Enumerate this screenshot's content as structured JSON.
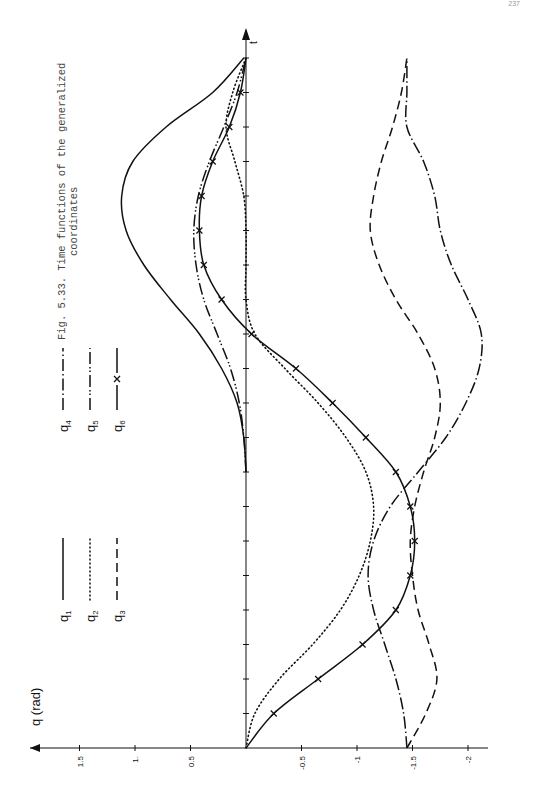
{
  "page": {
    "number": "237"
  },
  "caption": {
    "line1": "Fig. 5.33. Time functions of the generalized",
    "line2": "coordinates"
  },
  "chart_data": {
    "type": "line",
    "title": "Time functions of the generalized coordinates",
    "orientation": "rotated 90° counter-clockwise (t axis vertical pointing up, q axis horizontal with positive values to the left)",
    "xlabel": "t",
    "ylabel": "q (rad)",
    "ylim": [
      -2.3,
      1.8
    ],
    "yticks": [
      1.5,
      1,
      0.5,
      0,
      -0.5,
      -1,
      -1.5,
      -2
    ],
    "ytick_labels": [
      "1.5",
      "1.",
      "0.5",
      "",
      "-0.5",
      "-1",
      "-1.5",
      "-2"
    ],
    "xlim": [
      0,
      20.8
    ],
    "x_tick_count": 20,
    "x_tick_labels": [],
    "grid": false,
    "legend_position": "upper-left (rotated), two columns",
    "x": [
      0,
      1,
      2,
      3,
      4,
      5,
      6,
      7,
      8,
      9,
      10,
      11,
      12,
      13,
      14,
      15,
      16,
      17,
      18,
      19,
      20
    ],
    "series": [
      {
        "name": "q1",
        "style": "solid",
        "values": [
          null,
          null,
          null,
          null,
          null,
          null,
          null,
          null,
          0,
          0.02,
          0.08,
          0.22,
          0.42,
          0.68,
          0.92,
          1.08,
          1.12,
          1.02,
          0.72,
          0.3,
          0.02
        ]
      },
      {
        "name": "q2",
        "style": "dotted",
        "values": [
          0,
          -0.08,
          -0.3,
          -0.6,
          -0.85,
          -1.02,
          -1.12,
          -1.15,
          -1.08,
          -0.9,
          -0.65,
          -0.35,
          -0.08,
          0,
          0,
          0,
          0.02,
          0.1,
          0.18,
          0.12,
          0
        ]
      },
      {
        "name": "q3",
        "style": "dashed",
        "values": [
          -1.45,
          -1.62,
          -1.72,
          -1.65,
          -1.55,
          -1.5,
          -1.48,
          -1.52,
          -1.6,
          -1.7,
          -1.75,
          -1.7,
          -1.55,
          -1.35,
          -1.2,
          -1.12,
          -1.15,
          -1.22,
          -1.32,
          -1.4,
          -1.45
        ]
      },
      {
        "name": "q4",
        "style": "dash-dot",
        "values": [
          -1.45,
          -1.42,
          -1.35,
          -1.25,
          -1.15,
          -1.1,
          -1.15,
          -1.3,
          -1.55,
          -1.8,
          -1.98,
          -2.1,
          -2.12,
          -2.0,
          -1.85,
          -1.75,
          -1.7,
          -1.6,
          -1.45,
          -1.45,
          -1.45
        ]
      },
      {
        "name": "q5",
        "style": "dash-double-dot",
        "values": [
          null,
          null,
          null,
          null,
          null,
          null,
          null,
          null,
          0,
          0.02,
          0.06,
          0.14,
          0.26,
          0.38,
          0.45,
          0.47,
          0.43,
          0.33,
          0.2,
          0.08,
          0
        ]
      },
      {
        "name": "q6",
        "style": "solid with x markers",
        "values": [
          0,
          -0.25,
          -0.65,
          -1.05,
          -1.35,
          -1.48,
          -1.52,
          -1.48,
          -1.35,
          -1.08,
          -0.78,
          -0.45,
          -0.05,
          0.22,
          0.38,
          0.42,
          0.4,
          0.3,
          0.15,
          0.05,
          0
        ]
      }
    ]
  },
  "legend": {
    "items": [
      {
        "symbol": "q1",
        "style": "solid"
      },
      {
        "symbol": "q2",
        "style": "dotted"
      },
      {
        "symbol": "q3",
        "style": "dashed"
      },
      {
        "symbol": "q4",
        "style": "dash-dot"
      },
      {
        "symbol": "q5",
        "style": "dash-double-dot"
      },
      {
        "symbol": "q6",
        "style": "solid-x"
      }
    ]
  },
  "colors": {
    "ink": "#111111",
    "caption": "#444444",
    "background": "#ffffff"
  }
}
